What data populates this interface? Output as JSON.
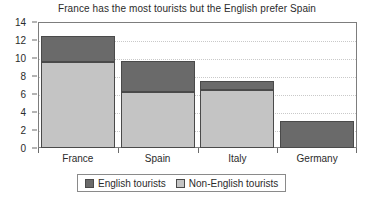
{
  "chart_data": {
    "type": "bar",
    "subtype": "stacked-vertical",
    "title": "France has the most tourists but the English prefer Spain",
    "xlabel": "",
    "ylabel": "",
    "categories": [
      "France",
      "Spain",
      "Italy",
      "Germany"
    ],
    "series": [
      {
        "name": "English tourists",
        "color": "#6a6a6a",
        "values": [
          2.8,
          3.5,
          1.0,
          3.0
        ]
      },
      {
        "name": "Non-English tourists",
        "color": "#c4c4c4",
        "values": [
          9.6,
          6.2,
          6.4,
          0.0
        ]
      }
    ],
    "totals": [
      12.4,
      9.7,
      7.4,
      3.0
    ],
    "ylim": [
      0,
      14
    ],
    "yticks": [
      0,
      2,
      4,
      6,
      8,
      10,
      12,
      14
    ],
    "ytick_labels": [
      "0",
      "2",
      "4",
      "6",
      "8",
      "10",
      "12",
      "14"
    ],
    "grid": true,
    "grid_axis": "y",
    "grid_style": "dotted",
    "legend_position": "bottom-center",
    "legend_entries": [
      "English tourists",
      "Non-English tourists"
    ],
    "stack_order": [
      "Non-English tourists",
      "English tourists"
    ]
  },
  "colors": {
    "english": "#6a6a6a",
    "non_english": "#c4c4c4",
    "frame": "#7d7d7d",
    "gridline": "#c9c9c9",
    "bar_outline": "#4a4a4a",
    "text": "#2b2b2b",
    "background": "#ffffff"
  }
}
